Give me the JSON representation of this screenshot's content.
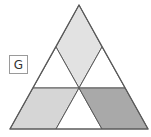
{
  "figure": {
    "label": "G",
    "colors": {
      "background": "#ffffff",
      "outline": "#5a5a5a",
      "diamond_fill": "#e2e2e2",
      "left_parallelogram_fill": "#d6d6d6",
      "right_parallelogram_fill": "#a9a9a9",
      "white_fill": "#ffffff"
    },
    "shapes": [
      {
        "name": "outer-triangle",
        "fill": "none"
      },
      {
        "name": "top-diamond",
        "fill": "light gray"
      },
      {
        "name": "left-white-triangle",
        "fill": "white"
      },
      {
        "name": "right-white-triangle",
        "fill": "white"
      },
      {
        "name": "left-parallelogram",
        "fill": "gray"
      },
      {
        "name": "bottom-white-triangle",
        "fill": "white"
      },
      {
        "name": "right-parallelogram",
        "fill": "dark gray"
      }
    ]
  }
}
